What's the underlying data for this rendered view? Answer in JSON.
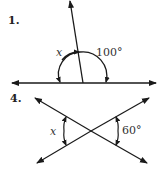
{
  "problems": [
    {
      "number": "1.",
      "unknown_label": "x",
      "given_angle": "100°",
      "description": "Linear pair formed by a line and a ray; angle x adjacent to 100° angle"
    },
    {
      "number": "4.",
      "unknown_label": "x",
      "given_angle": "60°",
      "description": "Two intersecting lines forming vertical angles x and 60°"
    }
  ],
  "colors": {
    "stroke": "#1a1a1a",
    "text": "#333333"
  }
}
